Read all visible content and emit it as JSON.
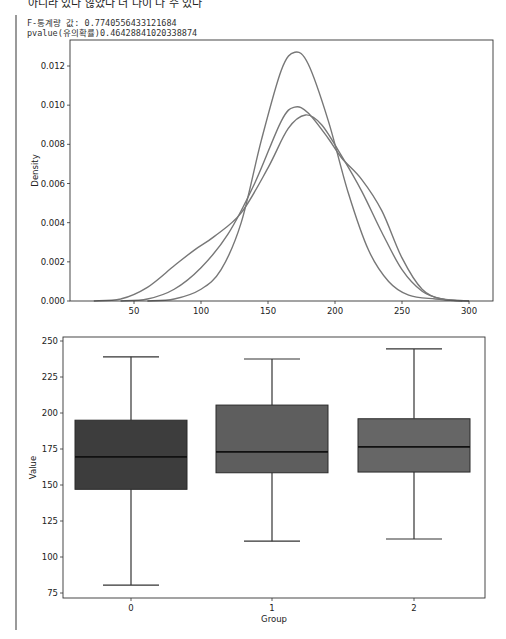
{
  "header": {
    "clipped_text": "아니라 있다 않았다 더 나이 나 수 있다",
    "f_stat_line": "F-통계량 값: 0.7740556433121684",
    "pvalue_line": "pvalue(유의확률)0.46428841020338874"
  },
  "colors": {
    "kde_line": "#777777",
    "box_0": "#3d3d3d",
    "box_1": "#5e5e5e",
    "box_2": "#666666",
    "axis": "#333333",
    "cell_border": "#9a9a9a"
  },
  "chart_data": [
    {
      "type": "line",
      "subtype": "kde",
      "title": "",
      "xlabel": "",
      "ylabel": "Density",
      "xlim": [
        5,
        315
      ],
      "ylim": [
        0,
        0.0133
      ],
      "xticks": [
        50,
        100,
        150,
        200,
        250,
        300
      ],
      "xtick_labels": [
        "50",
        "100",
        "150",
        "200",
        "250",
        "300"
      ],
      "yticks": [
        0,
        0.002,
        0.004,
        0.006,
        0.008,
        0.01,
        0.012
      ],
      "ytick_labels": [
        "0.000",
        "0.002",
        "0.004",
        "0.006",
        "0.008",
        "0.010",
        "0.012"
      ],
      "grid": false,
      "legend": null,
      "series": [
        {
          "name": "Group 0",
          "x": [
            20,
            40,
            60,
            80,
            95,
            110,
            130,
            150,
            165,
            178,
            190,
            205,
            220,
            235,
            250,
            265,
            280,
            300
          ],
          "y": [
            0,
            0.0001,
            0.0007,
            0.0018,
            0.0026,
            0.0033,
            0.0045,
            0.0068,
            0.0088,
            0.0095,
            0.009,
            0.0074,
            0.0056,
            0.0035,
            0.0016,
            0.0005,
            0.0001,
            0
          ]
        },
        {
          "name": "Group 1",
          "x": [
            40,
            60,
            80,
            100,
            120,
            140,
            160,
            170,
            180,
            195,
            205,
            220,
            235,
            250,
            265,
            280,
            300
          ],
          "y": [
            0,
            0.0001,
            0.0006,
            0.0017,
            0.0034,
            0.006,
            0.0092,
            0.0099,
            0.0096,
            0.0083,
            0.0073,
            0.0062,
            0.0046,
            0.0022,
            0.0006,
            0.0001,
            0
          ]
        },
        {
          "name": "Group 2",
          "x": [
            60,
            80,
            100,
            115,
            130,
            145,
            160,
            170,
            180,
            195,
            210,
            225,
            240,
            255,
            275,
            295
          ],
          "y": [
            0,
            0.0001,
            0.0006,
            0.0016,
            0.004,
            0.0082,
            0.0118,
            0.0127,
            0.0121,
            0.0092,
            0.0055,
            0.0026,
            0.001,
            0.0003,
            0.0001,
            0
          ]
        }
      ]
    },
    {
      "type": "box",
      "title": "",
      "xlabel": "Group",
      "ylabel": "Value",
      "categories": [
        "0",
        "1",
        "2"
      ],
      "ylim": [
        72,
        254
      ],
      "yticks": [
        75,
        100,
        125,
        150,
        175,
        200,
        225,
        250
      ],
      "ytick_labels": [
        "75",
        "100",
        "125",
        "150",
        "175",
        "200",
        "225",
        "250"
      ],
      "grid": false,
      "boxes": [
        {
          "group": "0",
          "whisker_low": 80.5,
          "q1": 147,
          "median": 169.5,
          "q3": 195,
          "whisker_high": 239
        },
        {
          "group": "1",
          "whisker_low": 111,
          "q1": 158.5,
          "median": 173,
          "q3": 205.5,
          "whisker_high": 237.5
        },
        {
          "group": "2",
          "whisker_low": 112.5,
          "q1": 159,
          "median": 176.5,
          "q3": 196,
          "whisker_high": 244.5
        }
      ]
    }
  ]
}
